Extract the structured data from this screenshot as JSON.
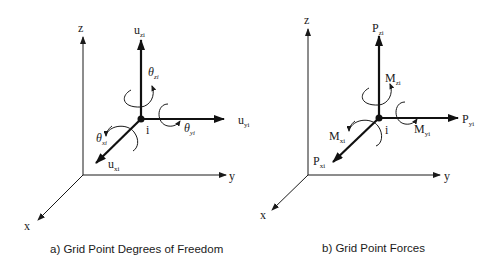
{
  "panels": [
    {
      "id": "a",
      "caption": "a) Grid Point Degrees of Freedom",
      "axes": {
        "x": "x",
        "y": "y",
        "z": "z"
      },
      "node_label": "i",
      "translations": {
        "x": {
          "base": "u",
          "sub": "xi"
        },
        "y": {
          "base": "u",
          "sub": "yi"
        },
        "z": {
          "base": "u",
          "sub": "zi"
        }
      },
      "rotations": {
        "x": {
          "base": "θ",
          "sub": "xi"
        },
        "y": {
          "base": "θ",
          "sub": "yi"
        },
        "z": {
          "base": "θ",
          "sub": "zi"
        }
      }
    },
    {
      "id": "b",
      "caption": "b) Grid Point Forces",
      "axes": {
        "x": "x",
        "y": "y",
        "z": "z"
      },
      "node_label": "i",
      "translations": {
        "x": {
          "base": "P",
          "sub": "xi"
        },
        "y": {
          "base": "P",
          "sub": "yi"
        },
        "z": {
          "base": "P",
          "sub": "zi"
        }
      },
      "rotations": {
        "x": {
          "base": "M",
          "sub": "xi"
        },
        "y": {
          "base": "M",
          "sub": "yi"
        },
        "z": {
          "base": "M",
          "sub": "zi"
        }
      }
    }
  ]
}
